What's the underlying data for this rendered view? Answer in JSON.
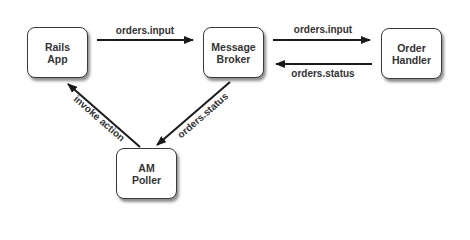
{
  "nodes": [
    {
      "id": "rails",
      "line1": "Rails",
      "line2": "App"
    },
    {
      "id": "broker",
      "line1": "Message",
      "line2": "Broker"
    },
    {
      "id": "handler",
      "line1": "Order",
      "line2": "Handler"
    },
    {
      "id": "poller",
      "line1": "AM",
      "line2": "Poller"
    }
  ],
  "edges": [
    {
      "from": "rails",
      "to": "broker",
      "label": "orders.input"
    },
    {
      "from": "broker",
      "to": "handler",
      "label": "orders.input"
    },
    {
      "from": "handler",
      "to": "broker",
      "label": "orders.status"
    },
    {
      "from": "broker",
      "to": "poller",
      "label": "orders.status"
    },
    {
      "from": "poller",
      "to": "rails",
      "label": "invoke action"
    }
  ],
  "colors": {
    "stroke": "#1a1a1a",
    "text": "#333333",
    "background": "#ffffff"
  }
}
